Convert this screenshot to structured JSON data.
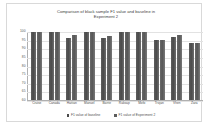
{
  "chart_data": {
    "type": "bar",
    "title": "Comparison of black sample F1 value and baseline in Experiment 2",
    "title_line1": "Comparison of black sample F1 value and baseline in",
    "title_line2": "Experiment 2",
    "xlabel": "",
    "ylabel": "",
    "ylim": [
      60,
      100
    ],
    "yticks": [
      100,
      95,
      90,
      85,
      80,
      75,
      70,
      65,
      60
    ],
    "grid": true,
    "legend_position": "bottom",
    "categories": [
      "Cruise",
      "Canada",
      "Haitian",
      "Manuel",
      "Barrie",
      "Raksap",
      "Mofo",
      "Trojan",
      "Vhen",
      "Zara"
    ],
    "series": [
      {
        "name": "F1 value of baseline",
        "color": "#4a4a4a",
        "values": [
          100,
          100,
          96.5,
          100,
          96.5,
          100,
          100,
          95.5,
          97,
          93.5
        ]
      },
      {
        "name": "F1 value of Experiment 2",
        "color": "#5d5d5d",
        "values": [
          100,
          100,
          98,
          100,
          97.5,
          100,
          100,
          95.5,
          98,
          93.5
        ]
      }
    ]
  },
  "colors": {
    "frame_border": "#d9d9d9",
    "gridline": "#e2e2e2",
    "axis": "#b0b0b0",
    "text": "#4f4f4f",
    "title_text": "#404040"
  }
}
